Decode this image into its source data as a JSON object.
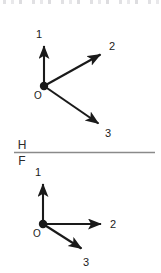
{
  "figure": {
    "type": "vector-diagram",
    "stroke_color": "#1a1a1a",
    "reference_line_color": "#8a8a8a",
    "background_color": "#ffffff"
  },
  "top_view": {
    "name": "top-view",
    "origin_label": "O",
    "origin": {
      "x": 44,
      "y": 86
    },
    "vectors": [
      {
        "label": "1",
        "name": "vector-1",
        "tip": {
          "x": 44,
          "y": 42
        },
        "label_pos": {
          "x": 39,
          "y": 38
        },
        "direction": "up"
      },
      {
        "label": "2",
        "name": "vector-2",
        "tip": {
          "x": 104,
          "y": 52
        },
        "label_pos": {
          "x": 110,
          "y": 50
        },
        "direction": "up-right"
      },
      {
        "label": "3",
        "name": "vector-3",
        "tip": {
          "x": 102,
          "y": 127
        },
        "label_pos": {
          "x": 106,
          "y": 137
        },
        "direction": "down-right"
      }
    ]
  },
  "reference_plane": {
    "name": "reference-plane",
    "upper_label": "H",
    "lower_label": "F",
    "line": {
      "x1": 14,
      "y1": 152,
      "x2": 155,
      "y2": 152
    },
    "upper_label_pos": {
      "x": 19,
      "y": 149
    },
    "lower_label_pos": {
      "x": 20,
      "y": 165
    }
  },
  "bottom_view": {
    "name": "bottom-view",
    "origin_label": "O",
    "origin": {
      "x": 43,
      "y": 224
    },
    "vectors": [
      {
        "label": "1",
        "name": "vector-1",
        "tip": {
          "x": 43,
          "y": 180
        },
        "label_pos": {
          "x": 38,
          "y": 176
        },
        "direction": "up"
      },
      {
        "label": "2",
        "name": "vector-2",
        "tip": {
          "x": 105,
          "y": 224
        },
        "label_pos": {
          "x": 111,
          "y": 228
        },
        "direction": "right"
      },
      {
        "label": "3",
        "name": "vector-3",
        "tip": {
          "x": 85,
          "y": 252
        },
        "label_pos": {
          "x": 84,
          "y": 266
        },
        "direction": "down-right"
      }
    ]
  }
}
